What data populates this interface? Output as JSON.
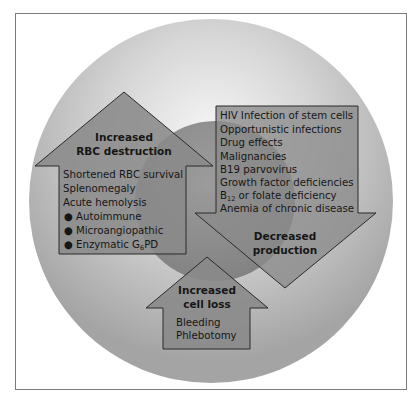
{
  "diagram": {
    "colors": {
      "frame": "#7a7a7a",
      "outer_circle_edge": "#9a9a9a",
      "outer_circle_center": "#f4f4f4",
      "inner_circle": "#7f7f7f",
      "arrow_fill": "#8a8a8a",
      "arrow_stroke": "#2a2a2a",
      "text": "#161616"
    },
    "increased_destruction": {
      "title_line1": "Increased",
      "title_line2": "RBC destruction",
      "items": [
        "Shortened RBC survival",
        "Splenomegaly",
        "Acute hemolysis"
      ],
      "bullets": [
        "Autoimmune",
        "Microangiopathic",
        "Enzymatic G",
        "6",
        "PD"
      ],
      "bullet_symbol": "●"
    },
    "decreased_production": {
      "items": [
        "HIV Infection of stem cells",
        "Opportunistic infections",
        "Drug effects",
        "Malignancies",
        "B19 parvovirus",
        "Growth factor deficiencies",
        "B",
        "12",
        " or folate deficiency",
        "Anemia of chronic disease"
      ],
      "title_line1": "Decreased",
      "title_line2": "production"
    },
    "increased_cell_loss": {
      "title_line1": "Increased",
      "title_line2": "cell loss",
      "items": [
        "Bleeding",
        "Phlebotomy"
      ]
    }
  }
}
